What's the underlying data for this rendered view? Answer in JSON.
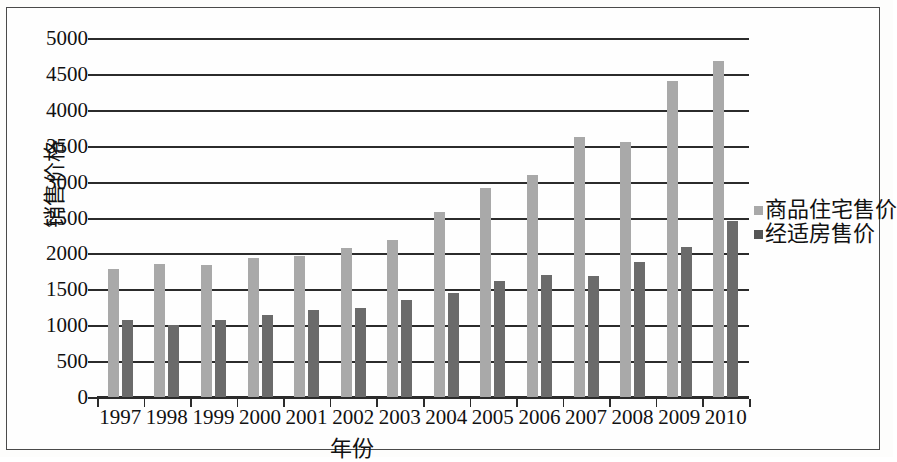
{
  "chart_data": {
    "type": "bar",
    "title": "",
    "xlabel": "年份",
    "ylabel": "销售价格",
    "ylim": [
      0,
      5000
    ],
    "ytick_step": 500,
    "yticks": [
      "0",
      "500",
      "1000",
      "1500",
      "2000",
      "2500",
      "3000",
      "3500",
      "4000",
      "4500",
      "5000"
    ],
    "grid": true,
    "legend_position": "right",
    "categories": [
      "1997",
      "1998",
      "1999",
      "2000",
      "2001",
      "2002",
      "2003",
      "2004",
      "2005",
      "2006",
      "2007",
      "2008",
      "2009",
      "2010"
    ],
    "series": [
      {
        "name": "商品住宅售价",
        "color": "#a9a9a9",
        "values": [
          1790,
          1860,
          1855,
          1950,
          1975,
          2090,
          2200,
          2590,
          2920,
          3110,
          3630,
          3560,
          4420,
          4700
        ]
      },
      {
        "name": "经适房售价",
        "color": "#6b6b6b",
        "values": [
          1080,
          1020,
          1080,
          1160,
          1230,
          1260,
          1360,
          1460,
          1630,
          1710,
          1700,
          1890,
          2110,
          2470
        ]
      }
    ]
  },
  "legend": {
    "items": [
      {
        "label": "商品住宅售价",
        "color": "#a9a9a9"
      },
      {
        "label": "经适房售价",
        "color": "#555555"
      }
    ]
  }
}
